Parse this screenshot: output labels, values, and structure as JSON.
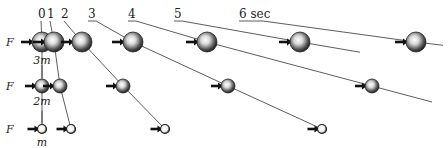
{
  "diagram": {
    "time_labels": [
      {
        "text": "0",
        "t": 0,
        "x": 38,
        "y": 18
      },
      {
        "text": "1",
        "t": 1,
        "x": 47,
        "y": 18
      },
      {
        "text": "2",
        "t": 2,
        "x": 61,
        "y": 18
      },
      {
        "text": "3",
        "t": 3,
        "x": 88,
        "y": 18
      },
      {
        "text": "4",
        "t": 4,
        "x": 128,
        "y": 18
      },
      {
        "text": "5",
        "t": 5,
        "x": 174,
        "y": 18
      },
      {
        "text": "6 sec",
        "t": 6,
        "x": 239,
        "y": 18
      }
    ],
    "rows": [
      {
        "mass_label": "3m",
        "force_label": "F",
        "y": 42,
        "radius": 10,
        "positions_x": [
          42,
          54,
          82,
          133,
          207,
          300,
          416
        ]
      },
      {
        "mass_label": "2m",
        "force_label": "F",
        "y": 86,
        "radius": 7,
        "positions_x": [
          42,
          60,
          123,
          228,
          372
        ]
      },
      {
        "mass_label": "m",
        "force_label": "F",
        "y": 129,
        "radius": 4.5,
        "positions_x": [
          42,
          71,
          165,
          322
        ]
      }
    ],
    "caption": "Equal force F applied to masses 3m, 2m and m; positions shown at 1-second intervals",
    "colors": {
      "ball_dark": "#222222",
      "ball_light": "#f4f4f4",
      "arrow": "#111111",
      "line": "#333333"
    }
  }
}
